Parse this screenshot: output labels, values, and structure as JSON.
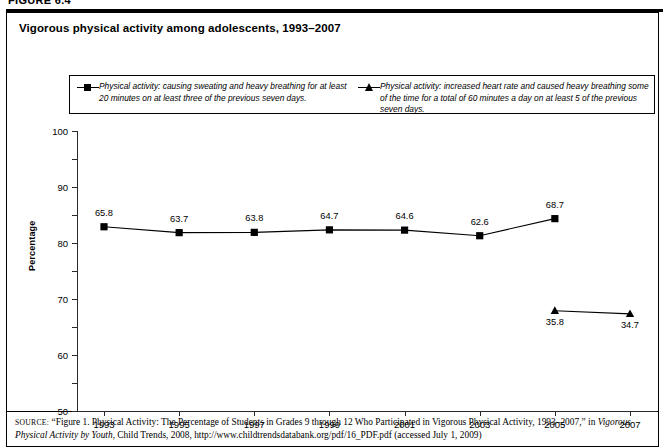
{
  "figure": {
    "number_label": "FIGURE 6.4"
  },
  "panel": {
    "title": "Vigorous physical activity among adolescents, 1993–2007"
  },
  "legend": {
    "entries": [
      {
        "marker": "square-marker-icon",
        "text": "Physical activity: causing sweating and heavy breathing for at least 20 minutes on at least three of the previous seven days."
      },
      {
        "marker": "triangle-marker-icon",
        "text": "Physical activity: increased heart rate and caused heavy breathing some of the time for a total of 60 minutes a day on at least 5 of the previous seven days."
      }
    ]
  },
  "chart_data": {
    "type": "line",
    "title": "Vigorous physical activity among adolescents, 1993–2007",
    "xlabel": "",
    "ylabel": "Percentage",
    "categories": [
      "1993",
      "1995",
      "1997",
      "1999",
      "2001",
      "2003",
      "2005",
      "2007"
    ],
    "ylim": [
      0,
      100
    ],
    "yticks": [
      0,
      10,
      20,
      30,
      40,
      50,
      60,
      70,
      80,
      90,
      100
    ],
    "grid": false,
    "legend_position": "top",
    "series": [
      {
        "name": "Physical activity: causing sweating and heavy breathing for at least 20 minutes on at least three of the previous seven days.",
        "marker": "square",
        "color": "#000000",
        "label_position": "above",
        "points": [
          {
            "x": "1993",
            "y": 65.8,
            "label": "65.8"
          },
          {
            "x": "1995",
            "y": 63.7,
            "label": "63.7"
          },
          {
            "x": "1997",
            "y": 63.8,
            "label": "63.8"
          },
          {
            "x": "1999",
            "y": 64.7,
            "label": "64.7"
          },
          {
            "x": "2001",
            "y": 64.6,
            "label": "64.6"
          },
          {
            "x": "2003",
            "y": 62.6,
            "label": "62.6"
          },
          {
            "x": "2005",
            "y": 68.7,
            "label": "68.7"
          }
        ]
      },
      {
        "name": "Physical activity: increased heart rate and caused heavy breathing some of the time for a total of 60 minutes a day on at least 5 of the previous seven days.",
        "marker": "triangle",
        "color": "#000000",
        "label_position": "below",
        "points": [
          {
            "x": "2005",
            "y": 35.8,
            "label": "35.8"
          },
          {
            "x": "2007",
            "y": 34.7,
            "label": "34.7"
          }
        ]
      }
    ]
  },
  "source": {
    "prefix": "source:",
    "part1": "“Figure 1. Physical Activity: The Percentage of Students in Grades 9 through 12 Who Participated in Vigorous Physical Activity, 1993–2007,” in ",
    "italic1": "Vigorous Physical Activity by Youth",
    "part2": ", Child Trends, 2008, http://www.childtrendsdatabank.org/pdf/16_PDF.pdf (accessed July 1, 2009)"
  },
  "colors": {
    "series": "#000000",
    "axis": "#2a2a2a",
    "border": "#000000",
    "background": "#ffffff"
  }
}
